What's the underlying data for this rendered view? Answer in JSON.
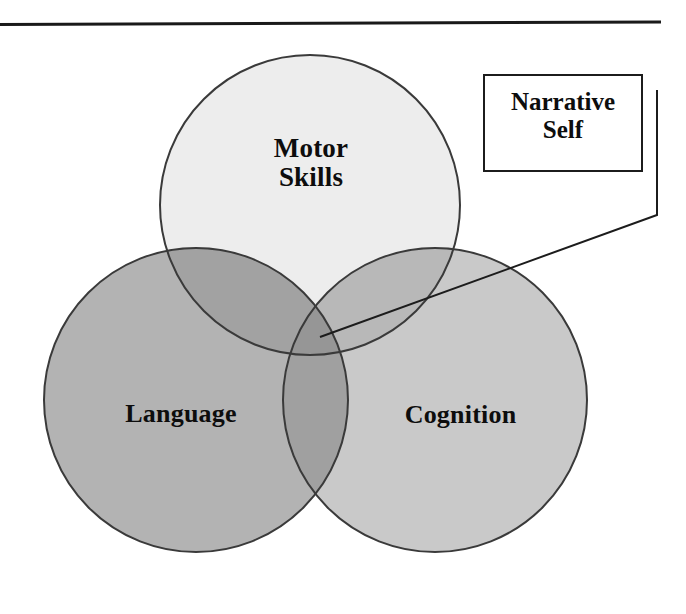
{
  "figure": {
    "type": "venn-diagram-3-set",
    "background_color": "#ffffff",
    "width": 686,
    "height": 614
  },
  "rule": {
    "name": "top-horizontal-rule",
    "color": "#1a1a1a"
  },
  "diagram": {
    "title": "",
    "sets": [
      {
        "id": "motor-skills",
        "label": "Motor\nSkills",
        "position": "top",
        "center_x": 310,
        "center_y": 205,
        "radius": 150,
        "fill": "#ededed",
        "stroke": "#3a3a3a"
      },
      {
        "id": "language",
        "label": "Language",
        "position": "bottom-left",
        "center_x": 196,
        "center_y": 400,
        "radius": 152,
        "fill": "#b3b3b3",
        "stroke": "#3a3a3a"
      },
      {
        "id": "cognition",
        "label": "Cognition",
        "position": "bottom-right",
        "center_x": 435,
        "center_y": 400,
        "radius": 152,
        "fill": "#c9c9c9",
        "stroke": "#3a3a3a"
      }
    ],
    "intersections": [
      {
        "id": "motor-language",
        "fill": "#a2a2a2"
      },
      {
        "id": "motor-cognition",
        "fill": "#b8b8b8"
      },
      {
        "id": "language-cognition",
        "fill": "#a0a0a0"
      },
      {
        "id": "motor-language-cognition",
        "fill": "#969696"
      }
    ]
  },
  "callout": {
    "label": "Narrative\nSelf",
    "border_color": "#1c1c1c",
    "background_color": "#ffffff",
    "leader_line": {
      "name": "callout-leader-line",
      "color": "#1c1c1c",
      "target_set": "motor-language-cognition"
    }
  }
}
